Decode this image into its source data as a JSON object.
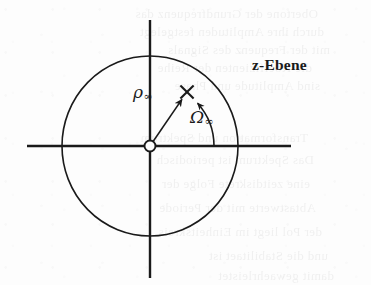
{
  "figure": {
    "background_color": "#fdfdfd",
    "ink_color": "#1a1a1a"
  },
  "labels": {
    "plane": "z-Ebene",
    "radius_symbol": "ρ",
    "radius_subscript": "∞",
    "angle_symbol": "Ω",
    "angle_subscript": "∞"
  },
  "geometry": {
    "center_x": 150,
    "center_y": 146,
    "radius_x": 88,
    "radius_y": 90,
    "h_axis_start_x": 27,
    "h_axis_end_x": 291,
    "v_axis_start_y": 20,
    "v_axis_end_y": 278,
    "pole_x": 187,
    "pole_y": 92,
    "angle_degrees": 48,
    "arc_radius": 64,
    "origin_marker_radius": 5.5,
    "stroke_width": 1.6,
    "axis_stroke_width": 2.4
  },
  "markers": {
    "origin": "open-circle",
    "pole": "cross-x",
    "radius_arrow": "arrowhead",
    "angle_arc_arrow": "arc-arrowhead"
  },
  "bleed_text": [
    {
      "text": "Obertone der Grundfrequenz das",
      "x": 18,
      "y": 6
    },
    {
      "text": "durch ihre Amplituden festgelegt",
      "x": 24,
      "y": 24
    },
    {
      "text": "mit der Frequenz des Signals",
      "x": 30,
      "y": 42
    },
    {
      "text": "die Koeffizienten der Reihe",
      "x": 12,
      "y": 60
    },
    {
      "text": "sind Amplitude und Phase",
      "x": 20,
      "y": 78
    },
    {
      "text": "Transformation und Spektrum",
      "x": 8,
      "y": 130
    },
    {
      "text": "Das Spektrum ist periodisch",
      "x": 14,
      "y": 152
    },
    {
      "text": "eine zeitdiskrete Folge der",
      "x": 10,
      "y": 176
    },
    {
      "text": "Abtastwerte mit der Periode",
      "x": 16,
      "y": 200
    },
    {
      "text": "der Pol liegt im Einheitskreis",
      "x": 22,
      "y": 224
    },
    {
      "text": "und die Stabilitaet ist",
      "x": 28,
      "y": 248
    },
    {
      "text": "damit gewaehrleistet",
      "x": 34,
      "y": 268
    }
  ]
}
